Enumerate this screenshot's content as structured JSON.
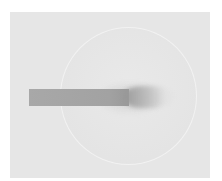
{
  "image": {
    "description": "Grayscale photograph of a circular disc with a rectangular rod entering from the left",
    "colors": {
      "outer_background": "#ffffff",
      "plate": "#e6e6e6",
      "disc": "#e8e8e8",
      "disc_rim": "#f2f2f2",
      "rod": "#a6a6a6",
      "rod_tip": "#999999"
    },
    "objects": [
      {
        "name": "plate",
        "shape": "rectangle"
      },
      {
        "name": "disc",
        "shape": "circle"
      },
      {
        "name": "rod",
        "shape": "rectangle"
      }
    ]
  }
}
